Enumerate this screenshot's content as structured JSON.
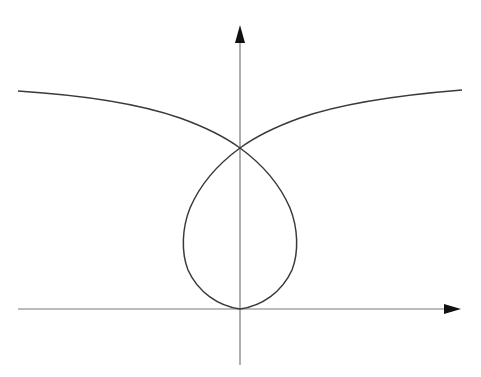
{
  "diagram": {
    "type": "plane-curve-with-axes",
    "colors": {
      "background": "#ffffff",
      "axis": "#7a7a7a",
      "curve": "#3a3a3a",
      "arrowhead": "#111111"
    },
    "axes": {
      "x_axis": {
        "from": [
          18,
          309
        ],
        "to": [
          461,
          309
        ],
        "arrow": "right"
      },
      "y_axis": {
        "from": [
          240,
          365
        ],
        "to": [
          240,
          25
        ],
        "arrow": "up"
      }
    },
    "curve": {
      "node_point": [
        240,
        148
      ],
      "loop_bottom": [
        240,
        309
      ],
      "loop_extent_x": [
        183,
        297
      ],
      "left_branch_end": [
        18,
        91
      ],
      "right_branch_end": [
        462,
        90
      ]
    }
  }
}
